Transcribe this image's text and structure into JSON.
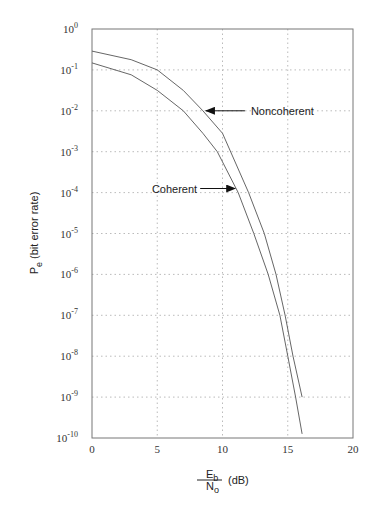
{
  "chart_data": {
    "type": "line",
    "title": "",
    "xlabel": {
      "numerator": "E",
      "numerator_sub": "b",
      "denominator": "N",
      "denominator_sub": "o",
      "unit": "(dB)"
    },
    "ylabel": {
      "main": "P",
      "sub": "e",
      "rest": "(bit error rate)"
    },
    "xlim": [
      0,
      20
    ],
    "ylim_exponent": [
      -10,
      0
    ],
    "yscale": "log",
    "grid": true,
    "x_ticks": [
      "0",
      "5",
      "10",
      "15",
      "20"
    ],
    "y_ticks": [
      {
        "base": "10",
        "exp": "0"
      },
      {
        "base": "10",
        "exp": "-1"
      },
      {
        "base": "10",
        "exp": "-2"
      },
      {
        "base": "10",
        "exp": "-3"
      },
      {
        "base": "10",
        "exp": "-4"
      },
      {
        "base": "10",
        "exp": "-5"
      },
      {
        "base": "10",
        "exp": "-6"
      },
      {
        "base": "10",
        "exp": "-7"
      },
      {
        "base": "10",
        "exp": "-8"
      },
      {
        "base": "10",
        "exp": "-9"
      },
      {
        "base": "10",
        "exp": "-10"
      }
    ],
    "series": [
      {
        "name": "Noncoherent",
        "x": [
          0,
          3,
          5,
          7,
          8.5,
          10,
          12.0,
          13.2,
          14.1,
          14.8,
          15.4,
          16.1
        ],
        "log10_y": [
          -0.54,
          -0.75,
          -1.0,
          -1.5,
          -2.0,
          -2.55,
          -4.0,
          -5.0,
          -6.0,
          -7.0,
          -8.0,
          -9.0
        ]
      },
      {
        "name": "Coherent",
        "x": [
          0,
          3,
          5,
          7,
          8.5,
          9.6,
          11.2,
          12.4,
          13.5,
          14.4,
          15.0,
          15.6,
          16.1
        ],
        "log10_y": [
          -0.83,
          -1.12,
          -1.5,
          -2.0,
          -2.55,
          -3.0,
          -4.0,
          -5.0,
          -6.0,
          -7.0,
          -8.0,
          -9.0,
          -9.9
        ]
      }
    ],
    "annotations": [
      {
        "text": "Noncoherent",
        "target_series": "Noncoherent",
        "x": 8.5,
        "log10_y": -2.0,
        "side": "right"
      },
      {
        "text": "Coherent",
        "target_series": "Coherent",
        "x": 11.2,
        "log10_y": -3.9,
        "side": "left"
      }
    ]
  }
}
